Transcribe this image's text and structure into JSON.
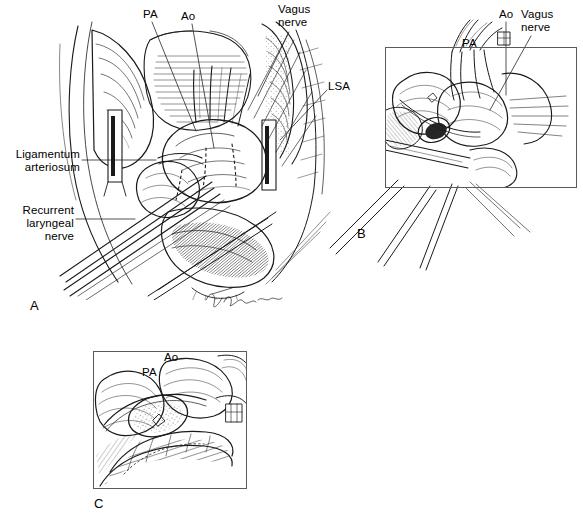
{
  "figure": {
    "background_color": "#ffffff",
    "ink_color": "#1a1a1a",
    "frame_color": "#5a5a5a",
    "width": 583,
    "height": 521,
    "style": "pen-and-ink surgical anatomy line drawing",
    "signature": "A. Johnson"
  },
  "panels": [
    {
      "letter": "A",
      "letter_x": 30,
      "letter_y": 298,
      "framed": false,
      "title": "Operative exposure of aortic arch and branches",
      "labels": [
        {
          "text": "PA",
          "x": 143,
          "y": 8,
          "align": "left"
        },
        {
          "text": "Ao",
          "x": 181,
          "y": 10,
          "align": "left"
        },
        {
          "text": "Vagus\nnerve",
          "x": 278,
          "y": 3,
          "align": "left"
        },
        {
          "text": "LSA",
          "x": 328,
          "y": 80,
          "align": "left"
        },
        {
          "text": "Ligamentum\narteriosum",
          "x": 4,
          "y": 148,
          "align": "left"
        },
        {
          "text": "Recurrent\nlaryngeal\nnerve",
          "x": 20,
          "y": 204,
          "align": "left"
        }
      ]
    },
    {
      "letter": "B",
      "letter_x": 357,
      "letter_y": 226,
      "framed": true,
      "frame": {
        "x": 385,
        "y": 47,
        "w": 192,
        "h": 141
      },
      "title": "Close-up of vagus nerve and aortic arch relations",
      "labels": [
        {
          "text": "Ao",
          "x": 499,
          "y": 8,
          "align": "left"
        },
        {
          "text": "Vagus\nnerve",
          "x": 521,
          "y": 8,
          "align": "left"
        },
        {
          "text": "PA",
          "x": 462,
          "y": 37,
          "align": "left"
        }
      ]
    },
    {
      "letter": "C",
      "letter_x": 94,
      "letter_y": 496,
      "framed": true,
      "frame": {
        "x": 93,
        "y": 351,
        "w": 154,
        "h": 138
      },
      "title": "Completed repair with graft anastomosis",
      "labels": [
        {
          "text": "Ao",
          "x": 164,
          "y": 351,
          "align": "left"
        },
        {
          "text": "PA",
          "x": 142,
          "y": 366,
          "align": "left"
        }
      ]
    }
  ],
  "abbreviations": [
    {
      "short": "PA",
      "meaning": "pulmonary artery"
    },
    {
      "short": "Ao",
      "meaning": "aorta"
    },
    {
      "short": "LSA",
      "meaning": "left subclavian artery"
    }
  ],
  "leader_lines": [
    {
      "panel": "A",
      "from_label": "PA",
      "x1": 152,
      "y1": 22,
      "x2": 196,
      "y2": 131
    },
    {
      "panel": "A",
      "from_label": "Ao",
      "x1": 192,
      "y1": 24,
      "x2": 214,
      "y2": 148
    },
    {
      "panel": "A",
      "from_label": "Vagus nerve",
      "x1": 289,
      "y1": 32,
      "x2": 258,
      "y2": 96
    },
    {
      "panel": "A",
      "from_label": "LSA",
      "x1": 327,
      "y1": 90,
      "x2": 280,
      "y2": 140
    },
    {
      "panel": "A",
      "from_label": "Ligamentum arteriosum",
      "x1": 82,
      "y1": 160,
      "x2": 156,
      "y2": 160
    },
    {
      "panel": "A",
      "from_label": "Recurrent laryngeal nerve",
      "x1": 76,
      "y1": 219,
      "x2": 135,
      "y2": 219
    },
    {
      "panel": "B",
      "from_label": "Ao",
      "x1": 506,
      "y1": 22,
      "x2": 506,
      "y2": 95
    },
    {
      "panel": "B",
      "from_label": "Vagus nerve",
      "x1": 531,
      "y1": 36,
      "x2": 490,
      "y2": 110
    }
  ]
}
